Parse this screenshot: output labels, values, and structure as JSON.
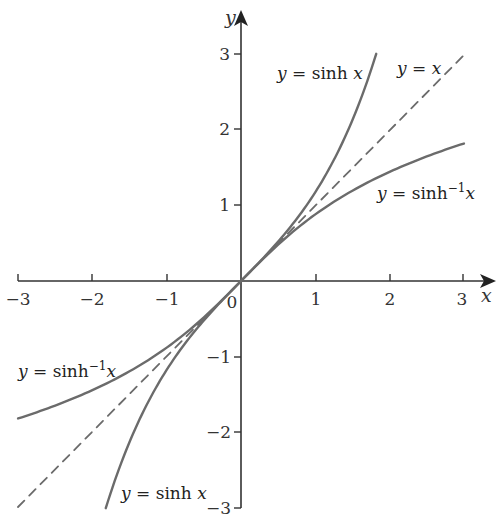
{
  "chart_data": {
    "type": "line",
    "title": "",
    "xlabel": "x",
    "ylabel": "y",
    "xlim": [
      -3,
      3
    ],
    "ylim": [
      -3,
      3
    ],
    "grid": false,
    "x_ticks": [
      -3,
      -2,
      -1,
      0,
      1,
      2,
      3
    ],
    "y_ticks": [
      -3,
      -2,
      -1,
      1,
      2,
      3
    ],
    "x_tick_labels": [
      "−3",
      "−2",
      "−1",
      "0",
      "1",
      "2",
      "3"
    ],
    "y_tick_labels": [
      "−3",
      "−2",
      "−1",
      "1",
      "2",
      "3"
    ],
    "origin_label": "0",
    "series": [
      {
        "name": "y = sinh x",
        "style": "solid",
        "color": "#6b6b6b",
        "x": [
          -1.82,
          -1.5,
          -1.2,
          -0.9,
          -0.6,
          -0.3,
          0,
          0.3,
          0.6,
          0.9,
          1.2,
          1.5,
          1.82
        ],
        "values": [
          -3.0,
          -2.13,
          -1.51,
          -1.03,
          -0.64,
          -0.3,
          0,
          0.3,
          0.64,
          1.03,
          1.51,
          2.13,
          3.0
        ]
      },
      {
        "name": "y = x",
        "style": "dashed",
        "color": "#6b6b6b",
        "x": [
          -3,
          3
        ],
        "values": [
          -3,
          3
        ]
      },
      {
        "name": "y = sinh⁻¹ x",
        "style": "solid",
        "color": "#6b6b6b",
        "x": [
          -3,
          -2.5,
          -2,
          -1.5,
          -1,
          -0.5,
          0,
          0.5,
          1,
          1.5,
          2,
          2.5,
          3
        ],
        "values": [
          -1.82,
          -1.65,
          -1.44,
          -1.19,
          -0.88,
          -0.48,
          0,
          0.48,
          0.88,
          1.19,
          1.44,
          1.65,
          1.82
        ]
      }
    ],
    "annotations": [
      {
        "text": "y = sinh x",
        "position": "upper right of sinh curve"
      },
      {
        "text": "y = x",
        "position": "upper right near dashed line"
      },
      {
        "text": "y = sinh⁻¹x",
        "position": "right, below asinh curve"
      },
      {
        "text": "y = sinh⁻¹x",
        "position": "left, above asinh curve"
      },
      {
        "text": "y = sinh x",
        "position": "bottom, right of sinh curve"
      }
    ]
  },
  "labels": {
    "x_axis": "x",
    "y_axis": "y",
    "origin": "0",
    "xt_m3": "−3",
    "xt_m2": "−2",
    "xt_m1": "−1",
    "xt_1": "1",
    "xt_2": "2",
    "xt_3": "3",
    "yt_3": "3",
    "yt_2": "2",
    "yt_1": "1",
    "yt_m1": "−1",
    "yt_m2": "−2",
    "yt_m3": "−3",
    "sinh_top_y": "y",
    "sinh_top_rest": " = sinh ",
    "sinh_top_x": "x",
    "yx_y": "y",
    "yx_eq": " = ",
    "yx_x": "x",
    "asinh_right_y": "y",
    "asinh_right_rest": " = sinh",
    "asinh_right_sup": "−1",
    "asinh_right_x": "x",
    "asinh_left_y": "y",
    "asinh_left_rest": " = sinh",
    "asinh_left_sup": "−1",
    "asinh_left_x": "x",
    "sinh_bot_y": "y",
    "sinh_bot_rest": " = sinh ",
    "sinh_bot_x": "x"
  }
}
